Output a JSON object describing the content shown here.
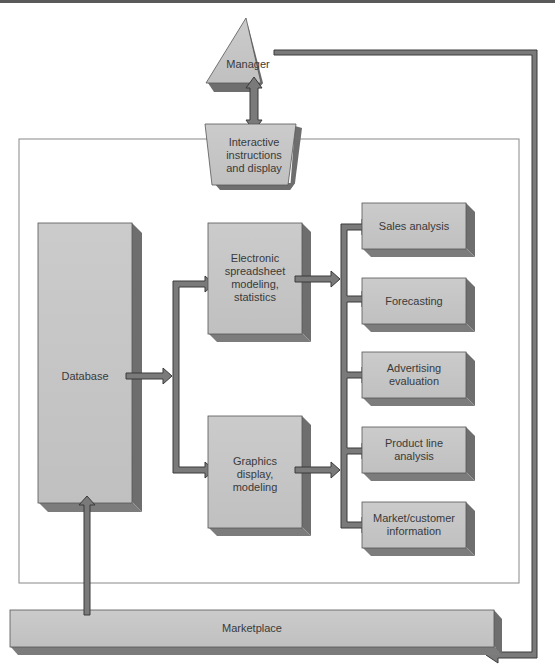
{
  "diagram": {
    "title": "",
    "colors": {
      "box_face": "#c6c6c6",
      "box_side": "#6e6e6e",
      "box_bottom": "#7c7c7c",
      "arrow_fill": "#7a7a7a",
      "arrow_stroke": "#3a3a3a",
      "frame": "#888888",
      "text": "#3a3a3a"
    },
    "nodes": {
      "manager": {
        "label": "Manager",
        "shape": "triangle"
      },
      "interactive": {
        "label": "Interactive\ninstructions\nand display",
        "shape": "trapezoid"
      },
      "database": {
        "label": "Database",
        "shape": "tall-box"
      },
      "spreadsheet": {
        "label": "Electronic\nspreadsheet\nmodeling,\nstatistics",
        "shape": "box"
      },
      "graphics": {
        "label": "Graphics\ndisplay,\nmodeling",
        "shape": "box"
      },
      "outputs": [
        {
          "label": "Sales analysis"
        },
        {
          "label": "Forecasting"
        },
        {
          "label": "Advertising\nevaluation"
        },
        {
          "label": "Product line\nanalysis"
        },
        {
          "label": "Market/customer\ninformation"
        }
      ],
      "marketplace": {
        "label": "Marketplace",
        "shape": "wide-box"
      }
    },
    "edges": [
      {
        "from": "manager",
        "to": "interactive",
        "type": "bidirectional"
      },
      {
        "from": "database",
        "to": "spreadsheet"
      },
      {
        "from": "database",
        "to": "graphics"
      },
      {
        "from": "spreadsheet",
        "to": "outputs"
      },
      {
        "from": "graphics",
        "to": "outputs"
      },
      {
        "from": "manager",
        "to": "marketplace"
      },
      {
        "from": "marketplace",
        "to": "database"
      }
    ]
  }
}
